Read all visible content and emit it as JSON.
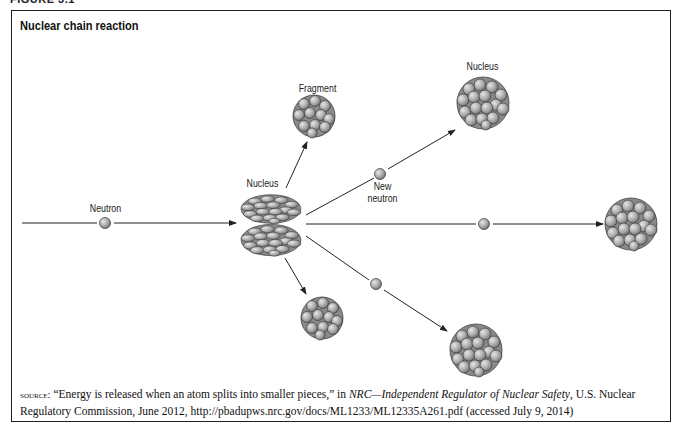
{
  "figure_label": "FIGURE 3.1",
  "title": "Nuclear chain reaction",
  "labels": {
    "neutron": "Neutron",
    "nucleus_center": "Nucleus",
    "fragment": "Fragment",
    "new_neutron_line1": "New",
    "new_neutron_line2": "neutron",
    "nucleus_top_right": "Nucleus"
  },
  "source": {
    "prefix": "source:",
    "quote": " “Energy is released when an atom splits into smaller pieces,” in ",
    "publication": "NRC—Independent Regulator of Nuclear Safety",
    "rest": ", U.S. Nuclear Regulatory Commission, June 2012, http://pbadupws.nrc.gov/docs/ML1233/ML12335A261.pdf (accessed July 9, 2014)"
  },
  "colors": {
    "sphere_fill": "#b0b0b0",
    "sphere_stroke": "#333333",
    "line": "#222222",
    "frame": "#222222"
  }
}
